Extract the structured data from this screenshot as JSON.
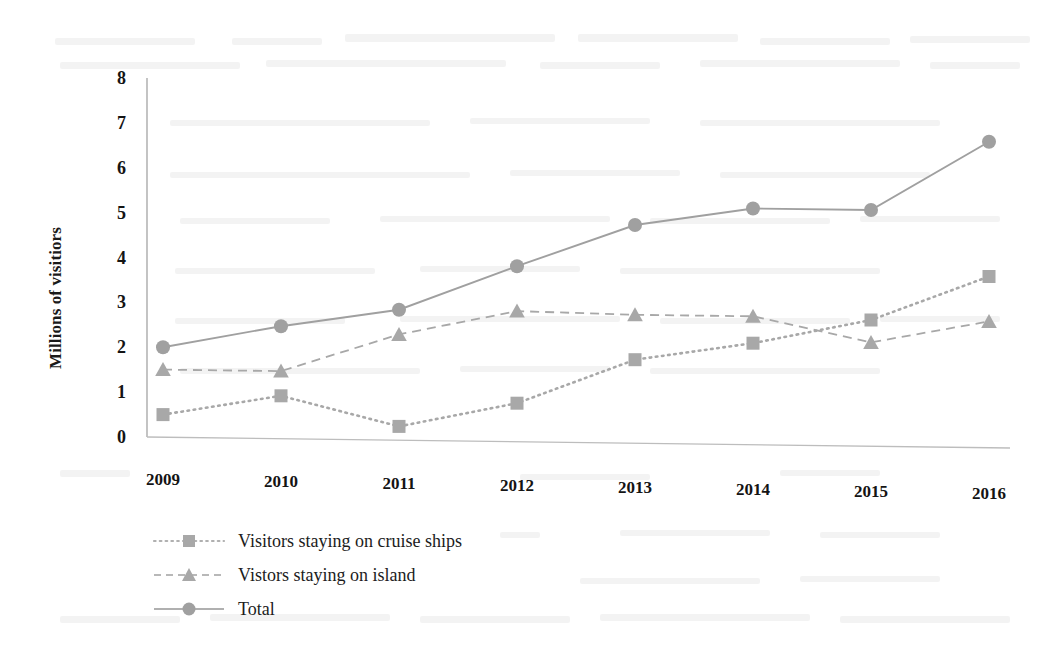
{
  "chart_data": {
    "type": "line",
    "title": "",
    "xlabel": "",
    "ylabel": "Millions of visitiors",
    "categories": [
      "2009",
      "2010",
      "2011",
      "2012",
      "2013",
      "2014",
      "2015",
      "2016"
    ],
    "ylim": [
      0,
      8
    ],
    "yticks": [
      "0",
      "1",
      "2",
      "3",
      "4",
      "5",
      "6",
      "7",
      "8"
    ],
    "grid": false,
    "legend_position": "bottom-left",
    "series": [
      {
        "name": "Visitors staying on cruise ships",
        "marker": "square",
        "line_style": "dotted",
        "color": "#a8a8a8",
        "values": [
          0.5,
          0.95,
          0.3,
          0.85,
          1.85,
          2.25,
          2.8,
          3.8
        ]
      },
      {
        "name": "Vistors staying on island",
        "marker": "triangle",
        "line_style": "dashed",
        "color": "#a8a8a8",
        "values": [
          1.5,
          1.5,
          2.35,
          2.9,
          2.85,
          2.85,
          2.3,
          2.8
        ]
      },
      {
        "name": "Total",
        "marker": "circle",
        "line_style": "solid",
        "color": "#a0a0a0",
        "values": [
          2.0,
          2.5,
          2.9,
          3.9,
          4.85,
          5.25,
          5.25,
          6.8
        ]
      }
    ]
  },
  "axis": {
    "axis_line_color": "#b5b5b5"
  }
}
